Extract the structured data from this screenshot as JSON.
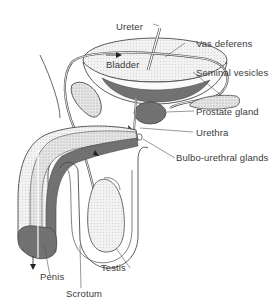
{
  "diagram": {
    "colors": {
      "background": "#ffffff",
      "line": "#4a4a4a",
      "dark_tissue": "#6e6e6e",
      "mid_tissue": "#9a9a9a",
      "light_tissue": "#d8d8d8",
      "label_text": "#3a3a3a"
    },
    "labels": {
      "ureter": "Ureter",
      "bladder": "Bladder",
      "vas_deferens": "Vas deferens",
      "seminal_vesicles": "Seminal vesicles",
      "prostate_gland": "Prostate gland",
      "urethra": "Urethra",
      "bulbo_urethral_glands": "Bulbo-urethral glands",
      "testis": "Testis",
      "penis": "Penis",
      "scrotum": "Scrotum"
    }
  }
}
